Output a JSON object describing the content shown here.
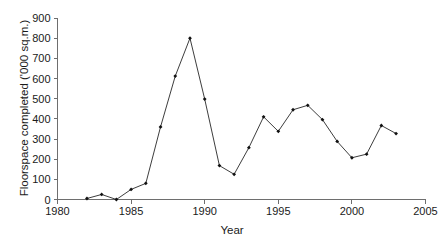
{
  "chart_data": {
    "type": "line",
    "title": "",
    "xlabel": "Year",
    "ylabel": "Floorspace completed ('000 sq.m.)",
    "xlim": [
      1980,
      2005
    ],
    "ylim": [
      0,
      900
    ],
    "xticks": [
      1980,
      1985,
      1990,
      1995,
      2000,
      2005
    ],
    "xtick_labels": [
      "1980",
      "1985",
      "1990",
      "1995",
      "2000",
      "2005"
    ],
    "yticks": [
      0,
      100,
      200,
      300,
      400,
      500,
      600,
      700,
      800,
      900
    ],
    "ytick_labels": [
      "0",
      "100",
      "200",
      "300",
      "400",
      "500",
      "600",
      "700",
      "800",
      "900"
    ],
    "grid": false,
    "legend": false,
    "legend_position": "none",
    "marker": "filled-diamond",
    "line_color": "#1a1a1a",
    "marker_color": "#111111",
    "x": [
      1982,
      1983,
      1984,
      1985,
      1986,
      1987,
      1988,
      1989,
      1990,
      1991,
      1992,
      1993,
      1994,
      1995,
      1996,
      1997,
      1998,
      1999,
      2000,
      2001,
      2002,
      2003
    ],
    "values": [
      5,
      25,
      0,
      50,
      80,
      360,
      612,
      800,
      498,
      168,
      125,
      257,
      410,
      338,
      445,
      467,
      396,
      288,
      207,
      225,
      367,
      327
    ],
    "series": [
      {
        "name": "Floorspace completed",
        "values": [
          5,
          25,
          0,
          50,
          80,
          360,
          612,
          800,
          498,
          168,
          125,
          257,
          410,
          338,
          445,
          467,
          396,
          288,
          207,
          225,
          367,
          327
        ]
      }
    ]
  }
}
